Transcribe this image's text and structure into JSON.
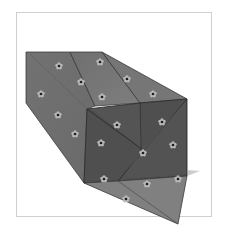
{
  "image": {
    "subject": "folded patterned box illustration",
    "alt": "Grey folded paper box with small flower pattern, shown in perspective with triangular folded flaps at the end"
  },
  "colors": {
    "background": "#ffffff",
    "frame": "#cfcfcf",
    "left_face": "#6e6e6e",
    "top_face": "#7a7a7a",
    "top_face_right": "#747474",
    "front_face_dark": "#4c4c4c",
    "front_flap_upper": "#5a5a5a",
    "front_flap_right": "#555555",
    "bottom_flap": "#7f7f7f",
    "edge": "#333333",
    "flower_petal": "#b8b8b8",
    "flower_center": "#1e1e1e"
  }
}
